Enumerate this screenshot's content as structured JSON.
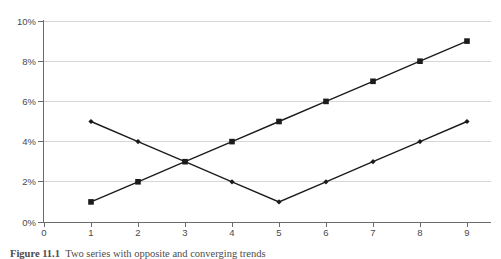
{
  "figure": {
    "caption_label": "Figure 11.1",
    "caption_text": "Two series with opposite and converging trends"
  },
  "chart_data": {
    "type": "line",
    "title": "",
    "xlabel": "",
    "ylabel": "",
    "x": [
      1,
      2,
      3,
      4,
      5,
      6,
      7,
      8,
      9
    ],
    "series": [
      {
        "name": "rising-series",
        "marker": "square",
        "values": [
          1,
          2,
          3,
          4,
          5,
          6,
          7,
          8,
          9
        ]
      },
      {
        "name": "v-shaped-series",
        "marker": "diamond",
        "values": [
          5,
          4,
          3,
          2,
          1,
          2,
          3,
          4,
          5
        ]
      }
    ],
    "xlim": [
      0,
      9.6
    ],
    "ylim": [
      0,
      10
    ],
    "xticks": [
      0,
      1,
      2,
      3,
      4,
      5,
      6,
      7,
      8,
      9
    ],
    "xtick_labels": [
      "0",
      "1",
      "2",
      "3",
      "4",
      "5",
      "6",
      "7",
      "8",
      "9"
    ],
    "yticks": [
      0,
      2,
      4,
      6,
      8,
      10
    ],
    "ytick_labels": [
      "0%",
      "2%",
      "4%",
      "6%",
      "8%",
      "10%"
    ],
    "grid": true,
    "grid_axis": "y",
    "legend": false,
    "line_color": "#1b1b1b",
    "grid_color": "#d6d6d6",
    "axis_color": "#6b6b6b"
  }
}
